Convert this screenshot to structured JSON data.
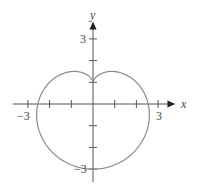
{
  "chart_data": {
    "type": "line",
    "title": "",
    "curve": "deltoid (three-cusped hypocycloid)",
    "parametric": {
      "x": "2 sin t + sin 2t",
      "y": "-(2 cos t + cos 2t)",
      "t_range": [
        0,
        6.2832
      ]
    },
    "key_points": {
      "cusps": [
        [
          0,
          -3
        ],
        [
          -2.598,
          1.5
        ],
        [
          2.598,
          1.5
        ]
      ],
      "top_of_upper_arc": [
        0,
        1
      ],
      "x_intercepts": [
        -1,
        1
      ]
    },
    "xlabel": "x",
    "ylabel": "y",
    "xlim": [
      -3.7,
      3.8
    ],
    "ylim": [
      -3.6,
      3.8
    ],
    "x_ticks": [
      -3,
      -2,
      -1,
      1,
      2,
      3
    ],
    "y_ticks": [
      -3,
      -2,
      -1,
      1,
      2,
      3
    ],
    "x_tick_labels": {
      "-3": "−3",
      "3": "3"
    },
    "y_tick_labels": {
      "-3": "−3",
      "3": "3"
    },
    "grid": false,
    "legend": null,
    "colors": {
      "curve": "#8a8a8a",
      "axis": "#555555",
      "background": "#ffffff"
    }
  },
  "labels": {
    "x_axis": "x",
    "y_axis": "y",
    "x_neg3": "−3",
    "x_pos3": "3",
    "y_pos3": "3",
    "y_neg3": "−3"
  }
}
